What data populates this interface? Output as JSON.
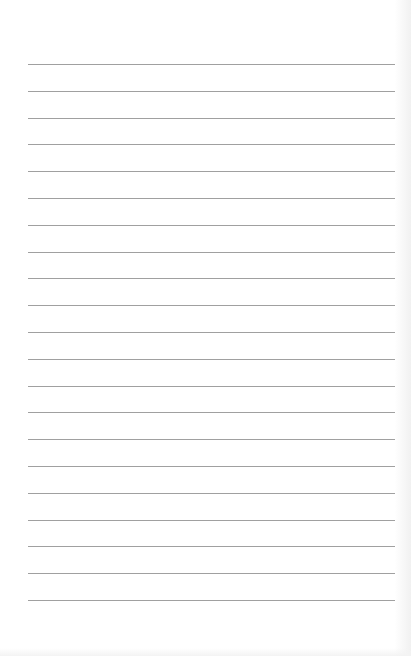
{
  "page": {
    "type": "lined-paper",
    "background_color": "#ffffff",
    "line_color": "#8f8f8f",
    "line_count": 21,
    "first_line_y": 64,
    "line_spacing": 26.8,
    "line_left": 28,
    "line_right": 395,
    "text": ""
  }
}
